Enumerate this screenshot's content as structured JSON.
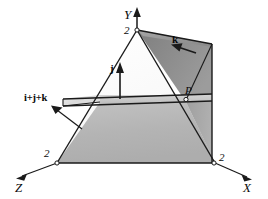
{
  "figure": {
    "background_color": "#ffffff",
    "line_color": "#1a1a1a",
    "axes": [
      {
        "name": "Y",
        "label": "Y",
        "direction": "up",
        "tick_label": "2",
        "tick_value": 2
      },
      {
        "name": "X",
        "label": "X",
        "direction": "down-right",
        "tick_label": "2",
        "tick_value": 2
      },
      {
        "name": "Z",
        "label": "Z",
        "direction": "down-left",
        "tick_label": "2",
        "tick_value": 2
      }
    ],
    "points": [
      {
        "name": "P",
        "label": "P"
      }
    ],
    "vectors": [
      {
        "name": "j",
        "label": "j",
        "direction": "up"
      },
      {
        "name": "k",
        "label": "k",
        "direction": "down-left"
      },
      {
        "name": "i+j+k",
        "label": "i+j+k",
        "direction": "up-left"
      }
    ],
    "surfaces": [
      {
        "name": "lower-trapezoid-face",
        "color": "#b4b4b4"
      },
      {
        "name": "upper-right-dark-face",
        "color": "#8d8d8d"
      },
      {
        "name": "right-side-face",
        "color": "#a8a8a8"
      },
      {
        "name": "cutting-plane-top",
        "color": "#c9c9c9"
      },
      {
        "name": "front-triangle-face",
        "color": "#fbfbfb"
      },
      {
        "name": "upper-right-quad-top",
        "color": "#9a9a9a"
      }
    ]
  }
}
